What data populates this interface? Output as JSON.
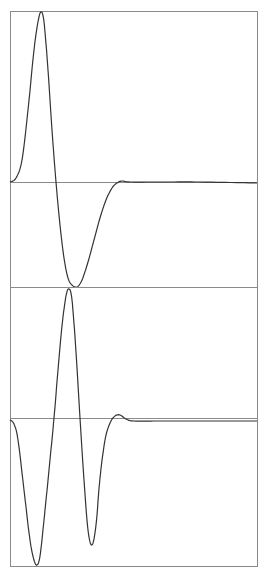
{
  "colors": {
    "frame": "#8a8a8a",
    "curve": "#333333",
    "background": "#ffffff"
  },
  "chart_data": [
    {
      "type": "line",
      "title": "",
      "xlabel": "",
      "ylabel": "",
      "grid": false,
      "legend": null,
      "description": "Upper panel: single positive lobe followed by a single negative lobe (first-derivative-of-Gaussian-like pulse), settling to zero baseline",
      "frame_px": {
        "x0": 10,
        "x1": 257,
        "y_top": 11,
        "y_bottom": 287,
        "y_baseline": 182
      },
      "x_px": [
        10,
        16,
        22,
        28,
        34,
        38,
        41,
        44,
        48,
        52,
        56,
        60,
        64,
        68,
        72,
        77,
        82,
        88,
        94,
        100,
        106,
        112,
        117,
        122,
        130,
        160,
        200,
        257
      ],
      "y_px": [
        182,
        178,
        160,
        110,
        50,
        22,
        12,
        22,
        70,
        130,
        182,
        225,
        258,
        278,
        285,
        287,
        280,
        262,
        240,
        218,
        200,
        188,
        183,
        181,
        182,
        182,
        182,
        183
      ]
    },
    {
      "type": "line",
      "title": "",
      "xlabel": "",
      "ylabel": "",
      "grid": false,
      "legend": null,
      "description": "Lower panel: negative lobe, tall positive peak, negative lobe, small overshoot then settling (second-derivative / inverted Mexican-hat-like pulse)",
      "frame_px": {
        "x0": 10,
        "x1": 257,
        "y_top": 287,
        "y_bottom": 566,
        "y_baseline": 418
      },
      "x_px": [
        10,
        14,
        18,
        24,
        30,
        34,
        37,
        40,
        44,
        49,
        54,
        58,
        62,
        66,
        69,
        72,
        76,
        80,
        84,
        88,
        92,
        96,
        100,
        105,
        110,
        115,
        120,
        126,
        134,
        160,
        200,
        257
      ],
      "y_px": [
        420,
        424,
        440,
        490,
        540,
        560,
        565,
        556,
        520,
        470,
        418,
        370,
        326,
        296,
        289,
        300,
        352,
        418,
        480,
        530,
        545,
        525,
        478,
        440,
        423,
        416,
        415,
        419,
        421,
        421,
        421,
        421
      ]
    }
  ]
}
